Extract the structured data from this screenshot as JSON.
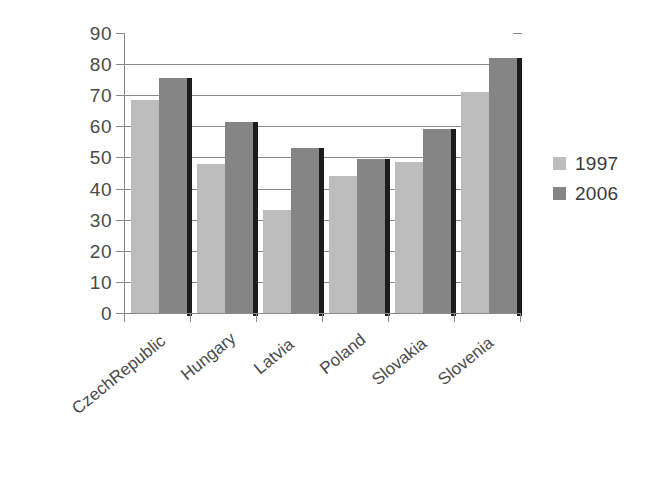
{
  "chart_data": {
    "type": "bar",
    "title": "",
    "subtitle": "",
    "xlabel": "",
    "ylabel": "",
    "categories": [
      "CzechRepublic",
      "Hungary",
      "Latvia",
      "Poland",
      "Slovakia",
      "Slovenia"
    ],
    "series": [
      {
        "name": "1997",
        "color": "#bdbdbd",
        "values": [
          68.5,
          48,
          33,
          44,
          48.5,
          71
        ]
      },
      {
        "name": "2006",
        "color": "#858585",
        "values": [
          75.5,
          61.5,
          53,
          49.5,
          59,
          82
        ]
      }
    ],
    "ylim": [
      0,
      90
    ],
    "ytick_values": [
      0,
      10,
      20,
      30,
      40,
      50,
      60,
      70,
      80,
      90
    ],
    "ytick_labels": [
      "0",
      "10",
      "20",
      "30",
      "40",
      "50",
      "60",
      "70",
      "80",
      "90"
    ],
    "grid": true,
    "grid_axis": "y",
    "legend_position": "right",
    "legend_entries": [
      "1997",
      "2006"
    ],
    "annotations": []
  },
  "legend": {
    "items": [
      {
        "label": "1997",
        "swatch_color": "#bdbdbd"
      },
      {
        "label": "2006",
        "swatch_color": "#858585"
      }
    ]
  },
  "axes": {
    "y_ticks": [
      "90",
      "80",
      "70",
      "60",
      "50",
      "40",
      "30",
      "20",
      "10",
      "0"
    ],
    "x_categories": [
      "CzechRepublic",
      "Hungary",
      "Latvia",
      "Poland",
      "Slovakia",
      "Slovenia"
    ]
  },
  "colors": {
    "series_1997": "#bdbdbd",
    "series_2006": "#858585",
    "axis": "#8a8a8a",
    "text": "#3a3a3a",
    "background": "#ffffff"
  }
}
